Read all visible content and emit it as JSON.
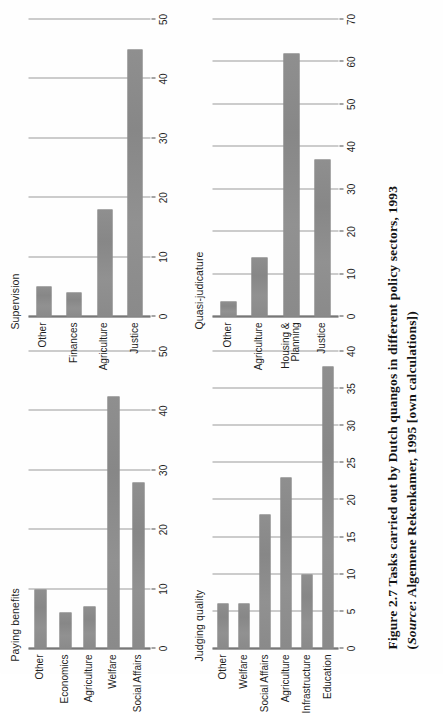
{
  "figure": {
    "caption_line1": "Figure 2.7  Tasks carried out by Dutch quangos in different policy sectors, 1993",
    "caption_line2_prefix": "(",
    "caption_source_word": "Source",
    "caption_line2_rest": ": Algemene Rekenkamer, 1995 [own calculations])",
    "background_color": "#fefefe",
    "bar_color": "#8d8d8d",
    "axis_color": "#4a4a4a",
    "grid_color": "#9a9a9a"
  },
  "chart_data": [
    {
      "id": "paying-benefits",
      "type": "bar",
      "title": "Paying benefits",
      "orientation": "vertical",
      "categories": [
        "Other",
        "Economics",
        "Agriculture",
        "Welfare",
        "Social Affairs"
      ],
      "values": [
        10,
        6,
        7,
        42.5,
        28
      ],
      "xlabel": "",
      "ylabel": "",
      "ylim": [
        0,
        50
      ],
      "yticks": [
        0,
        10,
        20,
        30,
        40,
        50
      ],
      "grid": true,
      "legend": "none"
    },
    {
      "id": "supervision",
      "type": "bar",
      "title": "Supervision",
      "orientation": "vertical",
      "categories": [
        "Other",
        "Finances",
        "Agriculture",
        "Justice"
      ],
      "values": [
        5,
        4,
        18,
        45
      ],
      "xlabel": "",
      "ylabel": "",
      "ylim": [
        0,
        50
      ],
      "yticks": [
        0,
        10,
        20,
        30,
        40,
        50
      ],
      "grid": true,
      "legend": "none"
    },
    {
      "id": "judging-quality",
      "type": "bar",
      "title": "Judging quality",
      "orientation": "vertical",
      "categories": [
        "Other",
        "Welfare",
        "Social Affairs",
        "Agriculture",
        "Infrastructure",
        "Education"
      ],
      "values": [
        6,
        6,
        18,
        23,
        10,
        38
      ],
      "xlabel": "",
      "ylabel": "",
      "ylim": [
        0,
        40
      ],
      "yticks": [
        0,
        5,
        10,
        15,
        20,
        25,
        30,
        35,
        40
      ],
      "grid": true,
      "legend": "none"
    },
    {
      "id": "quasi-judicature",
      "type": "bar",
      "title": "Quasi-judicature",
      "orientation": "vertical",
      "categories": [
        "Other",
        "Agriculture",
        "Housing &\nPlanning",
        "Justice"
      ],
      "values": [
        3.5,
        14,
        62,
        37
      ],
      "xlabel": "",
      "ylabel": "",
      "ylim": [
        0,
        70
      ],
      "yticks": [
        0,
        10,
        20,
        30,
        40,
        50,
        60,
        70
      ],
      "grid": true,
      "legend": "none"
    }
  ]
}
